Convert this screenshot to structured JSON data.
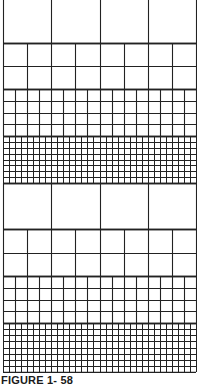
{
  "figure": {
    "caption": "FIGURE 1- 58",
    "line_color": "#222222",
    "background": "#ffffff",
    "sections": [
      {
        "name": "section-1",
        "bands": [
          {
            "name": "band-4col",
            "top": 0,
            "height": 43,
            "cols": 4,
            "rows": 1
          },
          {
            "name": "band-8col",
            "top": 43,
            "height": 46,
            "cols": 8,
            "rows": 2
          },
          {
            "name": "band-16col",
            "top": 89,
            "height": 47,
            "cols": 16,
            "rows": 4
          },
          {
            "name": "band-32col",
            "top": 136,
            "height": 47,
            "cols": 32,
            "rows": 8
          }
        ]
      },
      {
        "name": "section-2",
        "bands": [
          {
            "name": "band-4col",
            "top": 183,
            "height": 46,
            "cols": 4,
            "rows": 1
          },
          {
            "name": "band-8col",
            "top": 229,
            "height": 47,
            "cols": 8,
            "rows": 2
          },
          {
            "name": "band-16col",
            "top": 276,
            "height": 47,
            "cols": 16,
            "rows": 4
          },
          {
            "name": "band-32col",
            "top": 323,
            "height": 49,
            "cols": 32,
            "rows": 8
          }
        ]
      }
    ]
  }
}
